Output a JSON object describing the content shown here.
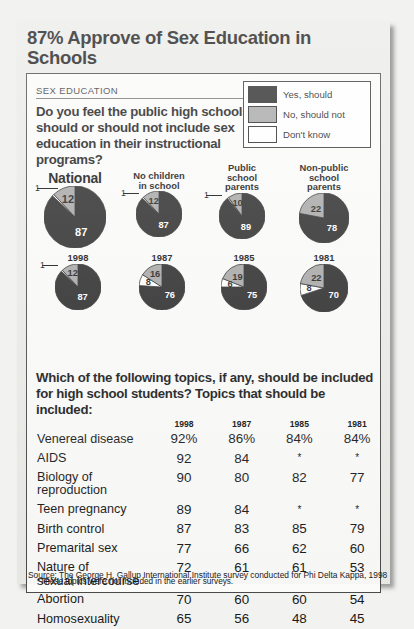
{
  "headline": "87% Approve of Sex Education in Schools",
  "kicker": "SEX EDUCATION",
  "question1": "Do you feel the public high schools should or should not include sex education in their instructional programs?",
  "question2": "Which of the following topics, if any, should be included for high school students? Topics that should be included:",
  "legend": {
    "items": [
      {
        "label": "Yes, should",
        "color": "#2b2b2b"
      },
      {
        "label": "No, should not",
        "color": "#a8a8a8"
      },
      {
        "label": "Don't know",
        "color": "#ffffff"
      }
    ]
  },
  "colors": {
    "yes": "#2b2b2b",
    "no": "#a8a8a8",
    "dontknow": "#ffffff",
    "card_bg": "#fbfbfa",
    "page_bg": "#ebebe8"
  },
  "note": "*These topics were not included in the earlier surveys.",
  "source": "Source: The George H. Gallup International Institute survey conducted for Phi Delta Kappa, 1998",
  "chart_data": [
    {
      "type": "pie",
      "title": "National",
      "categories": [
        "Yes, should",
        "No, should not",
        "Don't know"
      ],
      "values": [
        87,
        12,
        1
      ],
      "labels": [
        "87",
        "12",
        "1"
      ]
    },
    {
      "type": "pie",
      "title": "No children in school",
      "categories": [
        "Yes, should",
        "No, should not",
        "Don't know"
      ],
      "values": [
        87,
        12,
        1
      ],
      "labels": [
        "87",
        "12",
        "1"
      ]
    },
    {
      "type": "pie",
      "title": "Public school parents",
      "categories": [
        "Yes, should",
        "No, should not",
        "Don't know"
      ],
      "values": [
        89,
        10,
        1
      ],
      "labels": [
        "89",
        "10",
        "1"
      ]
    },
    {
      "type": "pie",
      "title": "Non-public school parents",
      "categories": [
        "Yes, should",
        "No, should not",
        "Don't know"
      ],
      "values": [
        78,
        22,
        0
      ],
      "labels": [
        "78",
        "22",
        ""
      ]
    },
    {
      "type": "pie",
      "title": "1998",
      "categories": [
        "Yes, should",
        "No, should not",
        "Don't know"
      ],
      "values": [
        87,
        12,
        1
      ],
      "labels": [
        "87",
        "12",
        "1"
      ]
    },
    {
      "type": "pie",
      "title": "1987",
      "categories": [
        "Yes, should",
        "No, should not",
        "Don't know"
      ],
      "values": [
        76,
        16,
        8
      ],
      "labels": [
        "76",
        "16",
        "8"
      ]
    },
    {
      "type": "pie",
      "title": "1985",
      "categories": [
        "Yes, should",
        "No, should not",
        "Don't know"
      ],
      "values": [
        75,
        19,
        6
      ],
      "labels": [
        "75",
        "19",
        "6"
      ]
    },
    {
      "type": "pie",
      "title": "1981",
      "categories": [
        "Yes, should",
        "No, should not",
        "Don't know"
      ],
      "values": [
        70,
        22,
        8
      ],
      "labels": [
        "70",
        "22",
        "8"
      ]
    },
    {
      "type": "table",
      "title": "Topics that should be included",
      "columns": [
        "",
        "1998",
        "1987",
        "1985",
        "1981"
      ],
      "rows": [
        {
          "topic": "Venereal disease",
          "topic2": "",
          "v": [
            "92%",
            "86%",
            "84%",
            "84%"
          ]
        },
        {
          "topic": "AIDS",
          "topic2": "",
          "v": [
            "92",
            "84",
            "*",
            "*"
          ]
        },
        {
          "topic": "Biology of",
          "topic2": "reproduction",
          "v": [
            "90",
            "80",
            "82",
            "77"
          ]
        },
        {
          "topic": "Teen pregnancy",
          "topic2": "",
          "v": [
            "89",
            "84",
            "*",
            "*"
          ]
        },
        {
          "topic": "Birth control",
          "topic2": "",
          "v": [
            "87",
            "83",
            "85",
            "79"
          ]
        },
        {
          "topic": "Premarital sex",
          "topic2": "",
          "v": [
            "77",
            "66",
            "62",
            "60"
          ]
        },
        {
          "topic": "Nature of",
          "topic2": "sexual intercourse",
          "v": [
            "72",
            "61",
            "61",
            "53"
          ]
        },
        {
          "topic": "Abortion",
          "topic2": "",
          "v": [
            "70",
            "60",
            "60",
            "54"
          ]
        },
        {
          "topic": "Homosexuality",
          "topic2": "",
          "v": [
            "65",
            "56",
            "48",
            "45"
          ]
        }
      ]
    }
  ]
}
